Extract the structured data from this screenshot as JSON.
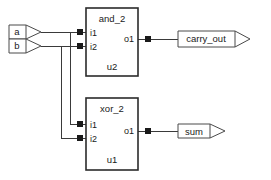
{
  "diagram": {
    "background_color": "#ffffff",
    "wire_color": "#3a3a3a",
    "block_border_color": "#2b2b2b"
  },
  "input_ports": [
    {
      "label": "a",
      "id": "input-port-a"
    },
    {
      "label": "b",
      "id": "input-port-b"
    }
  ],
  "blocks": [
    {
      "type_label": "and_2",
      "instance_label": "u2",
      "inputs": [
        "i1",
        "i2"
      ],
      "outputs": [
        "o1"
      ]
    },
    {
      "type_label": "xor_2",
      "instance_label": "u1",
      "inputs": [
        "i1",
        "i2"
      ],
      "outputs": [
        "o1"
      ]
    }
  ],
  "output_ports": [
    {
      "label": "carry_out",
      "id": "output-port-carry-out"
    },
    {
      "label": "sum",
      "id": "output-port-sum"
    }
  ]
}
